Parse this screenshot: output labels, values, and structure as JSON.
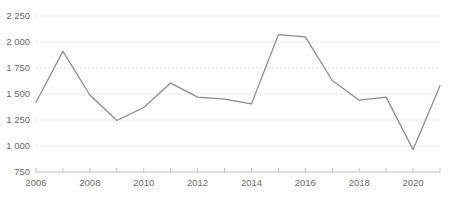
{
  "chart_data": {
    "type": "line",
    "title": "",
    "subtitle": "",
    "xlabel": "",
    "ylabel": "",
    "x": [
      2006,
      2007,
      2008,
      2009,
      2010,
      2011,
      2012,
      2013,
      2014,
      2015,
      2016,
      2017,
      2018,
      2019,
      2020,
      2021
    ],
    "series": [
      {
        "name": "",
        "values": [
          1420,
          1910,
          1490,
          1245,
          1370,
          1605,
          1470,
          1450,
          1405,
          2070,
          2050,
          1630,
          1440,
          1470,
          965,
          1580
        ]
      }
    ],
    "xlim": [
      2006,
      2021
    ],
    "ylim": [
      750,
      2250
    ],
    "ytick_values": [
      750,
      1000,
      1250,
      1500,
      1750,
      2000,
      2250
    ],
    "ytick_labels": [
      "750",
      "1 000",
      "1 250",
      "1 500",
      "1 750",
      "2 000",
      "2 250"
    ],
    "xtick_values": [
      2006,
      2007,
      2008,
      2009,
      2010,
      2011,
      2012,
      2013,
      2014,
      2015,
      2016,
      2017,
      2018,
      2019,
      2020,
      2021
    ],
    "xtick_labels": [
      "2006",
      "",
      "2008",
      "",
      "2010",
      "",
      "2012",
      "",
      "2014",
      "",
      "2016",
      "",
      "2018",
      "",
      "2020",
      ""
    ],
    "grid": true,
    "grid_axis": "y",
    "legend": false,
    "legend_position": "none",
    "line_color": "#8a8a8a",
    "grid_color": "#cfcfcf",
    "axis_color": "#b0b0b0",
    "label_color": "#6b6b6b",
    "background_color": "#ffffff",
    "annotations": []
  },
  "layout": {
    "plot_left": 36,
    "plot_right": 440,
    "plot_top": 16,
    "plot_bottom": 172,
    "tick_length": 4,
    "xlabel_offset": 7,
    "ylabel_offset": 6
  }
}
